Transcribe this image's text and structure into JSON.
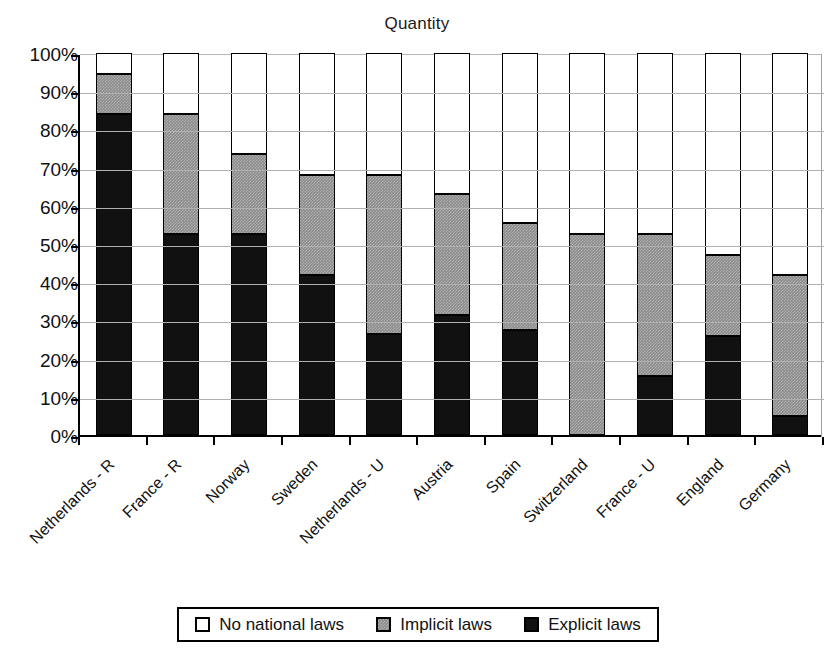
{
  "chart_data": {
    "type": "bar",
    "title": "Quantity",
    "xlabel": "",
    "ylabel": "",
    "ylim": [
      0,
      100
    ],
    "grid": true,
    "stacked": true,
    "stack_mode": "percent",
    "legend_position": "bottom",
    "ytick_labels": [
      "100%",
      "90%",
      "80%",
      "70%",
      "60%",
      "50%",
      "40%",
      "30%",
      "20%",
      "10%",
      "0%"
    ],
    "ytick_values": [
      100,
      90,
      80,
      70,
      60,
      50,
      40,
      30,
      20,
      10,
      0
    ],
    "categories": [
      "Netherlands - R",
      "France - R",
      "Norway",
      "Sweden",
      "Netherlands - U",
      "Austria",
      "Spain",
      "Switzerland",
      "France - U",
      "England",
      "Germany"
    ],
    "series": [
      {
        "name": "Explicit laws",
        "color": "#111111",
        "values": [
          84.0,
          52.5,
          52.5,
          42.0,
          26.5,
          31.5,
          27.5,
          0.0,
          15.5,
          26.0,
          5.0
        ]
      },
      {
        "name": "Implicit laws",
        "color": "#8a8a8a",
        "values": [
          10.5,
          31.5,
          21.0,
          26.0,
          41.5,
          31.5,
          28.0,
          52.5,
          37.0,
          21.0,
          37.0
        ]
      },
      {
        "name": "No national laws",
        "color": "#ffffff",
        "values": [
          5.5,
          16.0,
          26.5,
          32.0,
          32.0,
          37.0,
          44.5,
          47.5,
          47.5,
          53.0,
          58.0
        ]
      }
    ],
    "cumulative_tops": {
      "explicit": [
        84.0,
        52.5,
        52.5,
        42.0,
        26.5,
        31.5,
        27.5,
        0.0,
        15.5,
        26.0,
        5.0
      ],
      "implicit": [
        94.5,
        84.0,
        73.5,
        68.0,
        68.0,
        63.0,
        55.5,
        52.5,
        52.5,
        47.0,
        42.0
      ],
      "none": [
        100,
        100,
        100,
        100,
        100,
        100,
        100,
        100,
        100,
        100,
        100
      ]
    }
  },
  "legend": {
    "items": [
      {
        "label": "No national laws",
        "key": "none"
      },
      {
        "label": "Implicit laws",
        "key": "implicit"
      },
      {
        "label": "Explicit laws",
        "key": "explicit"
      }
    ]
  }
}
